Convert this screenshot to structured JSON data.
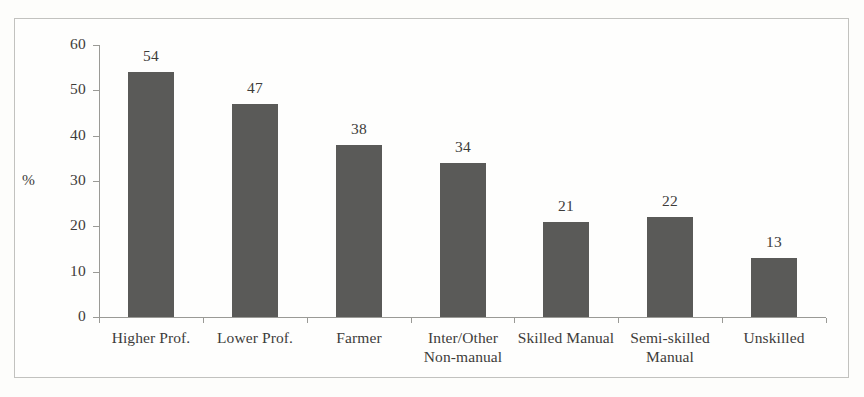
{
  "figure": {
    "background_color": "#fdfdfb",
    "frame_color": "#c2c2bf",
    "axis_color": "#9a9a96",
    "bar_color": "#5a5a58",
    "text_color": "#3d3c3a"
  },
  "chart_data": {
    "type": "bar",
    "title": "",
    "subtitle": "",
    "xlabel": "",
    "ylabel": "%",
    "ylim": [
      0,
      60
    ],
    "ytick_values": [
      0,
      10,
      20,
      30,
      40,
      50,
      60
    ],
    "ytick_labels": [
      "0",
      "10",
      "20",
      "30",
      "40",
      "50",
      "60"
    ],
    "grid": false,
    "legend": false,
    "legend_position": "none",
    "show_value_labels": true,
    "categories": [
      "Higher Prof.",
      "Lower Prof.",
      "Farmer",
      "Inter/Other Non-manual",
      "Skilled Manual",
      "Semi-skilled Manual",
      "Unskilled"
    ],
    "category_label_lines": [
      [
        "Higher Prof."
      ],
      [
        "Lower Prof."
      ],
      [
        "Farmer"
      ],
      [
        "Inter/Other",
        "Non-manual"
      ],
      [
        "Skilled Manual"
      ],
      [
        "Semi-skilled",
        "Manual"
      ],
      [
        "Unskilled"
      ]
    ],
    "values": [
      54,
      47,
      38,
      34,
      21,
      22,
      13
    ],
    "value_labels": [
      "54",
      "47",
      "38",
      "34",
      "21",
      "22",
      "13"
    ]
  }
}
